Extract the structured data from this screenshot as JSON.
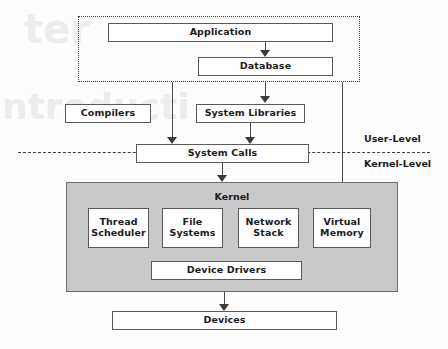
{
  "diagram": {
    "kernel_fill": "#c9c9c9",
    "box_border": "#5a5a5a",
    "user_group_label": "",
    "boundary": {
      "upper_label": "User-Level",
      "lower_label": "Kernel-Level"
    },
    "nodes": {
      "application": "Application",
      "database": "Database",
      "compilers": "Compilers",
      "system_libraries": "System Libraries",
      "system_calls": "System Calls",
      "kernel": "Kernel",
      "thread_scheduler": "Thread\nScheduler",
      "thread_scheduler_line1": "Thread",
      "thread_scheduler_line2": "Scheduler",
      "file_systems_line1": "File",
      "file_systems_line2": "Systems",
      "network_stack_line1": "Network",
      "network_stack_line2": "Stack",
      "virtual_memory_line1": "Virtual",
      "virtual_memory_line2": "Memory",
      "device_drivers": "Device Drivers",
      "devices": "Devices"
    }
  }
}
